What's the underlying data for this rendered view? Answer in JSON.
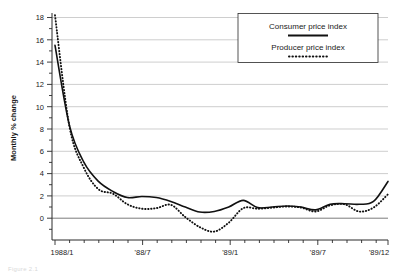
{
  "figure": {
    "caption_fragment": "Figure 2.1"
  },
  "legend": {
    "position": "top-right",
    "entries": [
      {
        "label": "Consumer price index",
        "style": "solid",
        "sample_name": "legend-sample-consumer"
      },
      {
        "label": "Producer price index",
        "style": "dotted",
        "sample_name": "legend-sample-producer"
      }
    ]
  },
  "chart_data": {
    "type": "line",
    "title": "",
    "subtitle": "",
    "xlabel": "",
    "ylabel": "Monthly % change",
    "ylim": [
      -2,
      18.6
    ],
    "xlim": [
      0,
      23
    ],
    "grid": true,
    "ytick_labels": [
      "18",
      "16",
      "14",
      "12",
      "10",
      "8",
      "6",
      "4",
      "2",
      "0"
    ],
    "yticks": [
      18,
      16,
      14,
      12,
      10,
      8,
      6,
      4,
      2,
      0
    ],
    "y_minor_ticks": [
      17,
      15,
      13,
      11,
      9,
      7,
      5,
      3,
      1,
      -1
    ],
    "xtick_labels": [
      "1988/1",
      "'88/7",
      "'89/1",
      "'89/7",
      "'89/12"
    ],
    "xtick_indices": [
      0,
      6,
      12,
      18,
      23
    ],
    "x_all_ticks": [
      0,
      1,
      2,
      3,
      4,
      5,
      6,
      7,
      8,
      9,
      10,
      11,
      12,
      13,
      14,
      15,
      16,
      17,
      18,
      19,
      20,
      21,
      22,
      23
    ],
    "x": [
      "1988/1",
      "1988/2",
      "1988/3",
      "1988/4",
      "1988/5",
      "1988/6",
      "1988/7",
      "1988/8",
      "1988/9",
      "1988/10",
      "1988/11",
      "1988/12",
      "1989/1",
      "1989/2",
      "1989/3",
      "1989/4",
      "1989/5",
      "1989/6",
      "1989/7",
      "1989/8",
      "1989/9",
      "1989/10",
      "1989/11",
      "1989/12"
    ],
    "series": [
      {
        "name": "Consumer price index",
        "style": "solid",
        "values": [
          15.5,
          8.3,
          5.0,
          3.3,
          2.4,
          1.85,
          1.95,
          1.85,
          1.5,
          1.0,
          0.55,
          0.6,
          1.0,
          1.6,
          1.75,
          2.25,
          1.45,
          1.1,
          1.2,
          1.5,
          1.2,
          1.05,
          0.95,
          0.9
        ]
      },
      {
        "name": "Producer price index",
        "style": "dotted",
        "values": [
          18.2,
          8.2,
          4.5,
          2.6,
          2.2,
          1.25,
          0.85,
          0.9,
          1.2,
          0.1,
          -0.8,
          -1.2,
          -0.4,
          0.9,
          1.5,
          1.7,
          1.1,
          0.75,
          0.95,
          1.35,
          0.95,
          0.7,
          0.65,
          0.9
        ]
      }
    ],
    "series_tail": [
      {
        "name": "Consumer price index",
        "values_tail": [
          0.95,
          1.0,
          1.1,
          1.0,
          0.75,
          1.25,
          1.3,
          1.25,
          1.5,
          3.3
        ]
      },
      {
        "name": "Producer price index",
        "values_tail": [
          0.85,
          0.95,
          1.05,
          0.95,
          0.6,
          1.15,
          1.25,
          0.6,
          0.95,
          2.15
        ]
      }
    ]
  }
}
